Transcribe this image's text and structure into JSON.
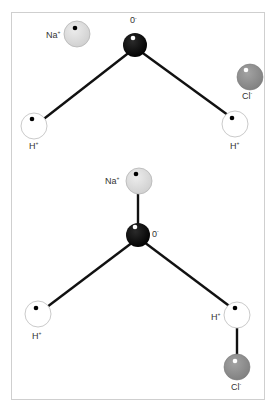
{
  "diagram": {
    "colors": {
      "frame": "#cfcfcf",
      "bond": "#111111",
      "oxygen": "#0a0a0a",
      "sodium": "#d9d9d9",
      "chlorine": "#8c8c8c",
      "hydrogen": "#ffffff",
      "atom_outline": "#bdbdbd"
    },
    "top_molecule": {
      "atoms": [
        {
          "id": "na",
          "element": "Na",
          "charge": "+",
          "label": "Na",
          "cx": 77,
          "cy": 34,
          "r": 13
        },
        {
          "id": "o",
          "element": "O",
          "charge": "-",
          "label": "0",
          "cx": 135,
          "cy": 45,
          "r": 12
        },
        {
          "id": "cl",
          "element": "Cl",
          "charge": "-",
          "label": "Cl",
          "cx": 250,
          "cy": 77,
          "r": 13
        },
        {
          "id": "h1",
          "element": "H",
          "charge": "+",
          "label": "H",
          "cx": 34,
          "cy": 126,
          "r": 13
        },
        {
          "id": "h2",
          "element": "H",
          "charge": "+",
          "label": "H",
          "cx": 235,
          "cy": 124,
          "r": 13
        }
      ],
      "bonds": [
        [
          "o",
          "h1"
        ],
        [
          "o",
          "h2"
        ]
      ]
    },
    "bottom_molecule": {
      "atoms": [
        {
          "id": "na",
          "element": "Na",
          "charge": "+",
          "label": "Na",
          "cx": 139,
          "cy": 181,
          "r": 13
        },
        {
          "id": "o",
          "element": "O",
          "charge": "-",
          "label": "0",
          "cx": 138,
          "cy": 235,
          "r": 12
        },
        {
          "id": "h1",
          "element": "H",
          "charge": "+",
          "label": "H",
          "cx": 38,
          "cy": 314,
          "r": 13
        },
        {
          "id": "h2",
          "element": "H",
          "charge": "+",
          "label": "H",
          "cx": 237,
          "cy": 315,
          "r": 13
        },
        {
          "id": "cl",
          "element": "Cl",
          "charge": "-",
          "label": "Cl",
          "cx": 237,
          "cy": 367,
          "r": 13
        }
      ],
      "bonds": [
        [
          "na",
          "o"
        ],
        [
          "o",
          "h1"
        ],
        [
          "o",
          "h2"
        ],
        [
          "h2",
          "cl"
        ]
      ]
    },
    "labels": {
      "top_na": "Na",
      "top_na_charge": "+",
      "top_o": "0",
      "top_o_charge": "-",
      "top_cl": "Cl",
      "top_cl_charge": "-",
      "top_h1": "H",
      "top_h1_charge": "+",
      "top_h2": "H",
      "top_h2_charge": "+",
      "bot_na": "Na",
      "bot_na_charge": "+",
      "bot_o": "0",
      "bot_o_charge": "-",
      "bot_h1": "H",
      "bot_h1_charge": "+",
      "bot_h2": "H",
      "bot_h2_charge": "+",
      "bot_cl": "Cl",
      "bot_cl_charge": "-"
    }
  }
}
